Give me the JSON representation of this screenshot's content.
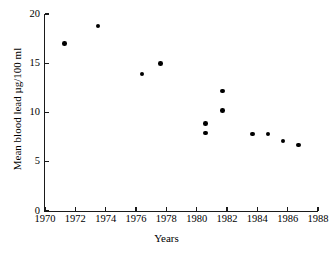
{
  "chart_data": {
    "type": "scatter",
    "title": "",
    "xlabel": "Years",
    "ylabel": "Mean blood lead µg/100 ml",
    "xlim": [
      1970,
      1988
    ],
    "ylim": [
      0,
      20
    ],
    "grid": false,
    "legend": null,
    "xticks": [
      1970,
      1972,
      1974,
      1976,
      1978,
      1980,
      1982,
      1984,
      1986,
      1988
    ],
    "xtick_labels": [
      "1970",
      "1972",
      "1974",
      "1976",
      "1978",
      "1980",
      "1982",
      "1984",
      "1986",
      "1988"
    ],
    "yticks": [
      0,
      5,
      10,
      15,
      20
    ],
    "ytick_labels": [
      "0",
      "5",
      "10",
      "15",
      "20"
    ],
    "marker": "filled-circle",
    "marker_color": "#000000",
    "points": [
      {
        "x": 1971.3,
        "y": 17.0
      },
      {
        "x": 1973.5,
        "y": 18.8
      },
      {
        "x": 1976.4,
        "y": 13.9
      },
      {
        "x": 1977.6,
        "y": 15.0
      },
      {
        "x": 1980.6,
        "y": 8.9
      },
      {
        "x": 1980.6,
        "y": 7.9
      },
      {
        "x": 1981.7,
        "y": 12.2
      },
      {
        "x": 1981.7,
        "y": 10.2
      },
      {
        "x": 1983.7,
        "y": 7.8
      },
      {
        "x": 1984.7,
        "y": 7.8
      },
      {
        "x": 1985.7,
        "y": 7.1
      },
      {
        "x": 1986.7,
        "y": 6.7
      }
    ]
  }
}
